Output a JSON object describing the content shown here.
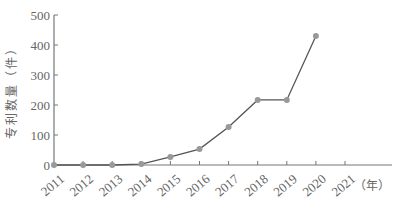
{
  "chart_data": {
    "type": "line",
    "title": "",
    "xlabel": "（年）",
    "ylabel": "专利数量（件）",
    "categories": [
      "2011",
      "2012",
      "2013",
      "2014",
      "2015",
      "2016",
      "2017",
      "2018",
      "2019",
      "2020",
      "2021"
    ],
    "series": [
      {
        "name": "专利数量",
        "x": [
          "2011",
          "2012",
          "2013",
          "2014",
          "2015",
          "2016",
          "2017",
          "2018",
          "2019",
          "2020"
        ],
        "values": [
          0,
          0,
          0,
          3,
          27,
          53,
          127,
          217,
          217,
          430
        ]
      }
    ],
    "yticks": [
      0,
      100,
      200,
      300,
      400,
      500
    ],
    "ylim": [
      0,
      500
    ],
    "grid": false,
    "legend": "none",
    "colors": {
      "line": "#555555",
      "marker": "#999999",
      "axis": "#777777"
    }
  }
}
